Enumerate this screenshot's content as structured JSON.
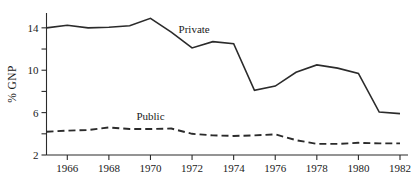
{
  "chart_data": {
    "type": "line",
    "title": "",
    "subtitle": "",
    "xlabel": "",
    "ylabel": "% GNP",
    "xlim": [
      1965,
      1982
    ],
    "ylim": [
      2,
      15.4
    ],
    "grid": false,
    "legend_position": "inline-annotation",
    "x": [
      1965,
      1966,
      1967,
      1968,
      1969,
      1970,
      1971,
      1972,
      1973,
      1974,
      1975,
      1976,
      1977,
      1978,
      1979,
      1980,
      1981,
      1982
    ],
    "xticks": [
      1966,
      1968,
      1970,
      1972,
      1974,
      1976,
      1978,
      1980,
      1982
    ],
    "xtick_labels": [
      "1966",
      "1968",
      "1970",
      "1972",
      "1974",
      "1976",
      "1978",
      "1980",
      "1982"
    ],
    "yticks": [
      2,
      4,
      6,
      8,
      10,
      12,
      14
    ],
    "ytick_labels": [
      "2",
      "",
      "6",
      "",
      "10",
      "",
      "14"
    ],
    "ytick_labels_shown": [
      "2",
      "6",
      "10",
      "14"
    ],
    "series": [
      {
        "name": "Private",
        "style": "solid",
        "annotation": "Private",
        "values": [
          14.0,
          14.25,
          14.0,
          14.05,
          14.2,
          14.9,
          13.6,
          12.1,
          12.7,
          12.5,
          8.1,
          8.5,
          9.8,
          10.5,
          10.2,
          9.7,
          6.05,
          5.9
        ]
      },
      {
        "name": "Public",
        "style": "dashed",
        "annotation": "Public",
        "values": [
          4.2,
          4.3,
          4.35,
          4.6,
          4.45,
          4.45,
          4.5,
          4.0,
          3.85,
          3.8,
          3.85,
          3.95,
          3.4,
          3.05,
          3.05,
          3.15,
          3.1,
          3.1
        ]
      }
    ],
    "annotations": [
      {
        "text": "Private",
        "x": 1972.1,
        "y": 13.55
      },
      {
        "text": "Public",
        "x": 1970.0,
        "y": 5.35
      }
    ],
    "colors": {
      "line": "#2b2b2b",
      "axis": "#2b2b2b",
      "text": "#1a1a1a",
      "background": "#ffffff"
    }
  }
}
